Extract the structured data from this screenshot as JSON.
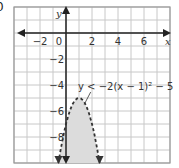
{
  "problem": {
    "number": "0"
  },
  "graph": {
    "origin_px": [
      66,
      33
    ],
    "unit_px": 13,
    "x_range": [
      -4,
      8
    ],
    "y_range": [
      -10,
      2
    ],
    "x_axis_label": "x",
    "y_axis_label": "y",
    "x_tick_labels": [
      {
        "value": -2,
        "text": "−2"
      },
      {
        "value": 0,
        "text": "0"
      },
      {
        "value": 2,
        "text": "2"
      },
      {
        "value": 4,
        "text": "4"
      },
      {
        "value": 6,
        "text": "6"
      }
    ],
    "y_tick_labels": [
      {
        "value": -2,
        "text": "−2"
      },
      {
        "value": -4,
        "text": "−4"
      },
      {
        "value": -6,
        "text": "−6"
      },
      {
        "value": -8,
        "text": "−8"
      }
    ],
    "inequality": {
      "text": "y < −2(x − 1)² − 5",
      "a": -2,
      "h": 1,
      "k": -5,
      "boundary": "dashed",
      "shading": "inside (below vertex)"
    },
    "colors": {
      "grid": "#c8c8c8",
      "border": "#999999",
      "axis": "#222222",
      "shade": "#dcdcdc",
      "curve": "#333333"
    }
  }
}
